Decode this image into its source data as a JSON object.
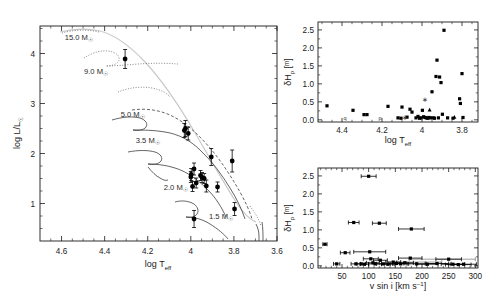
{
  "figure": {
    "panels": [
      {
        "id": "hrd",
        "name": "hertzsprung-russell-diagram",
        "xlabel": "log T",
        "xlabel_sub": "eff",
        "ylabel": "log L/L",
        "ylabel_sub": "☉",
        "xlim": [
          4.7,
          3.6
        ],
        "ylim": [
          0.25,
          4.55
        ],
        "xticks": [
          "4.6",
          "4.4",
          "4.2",
          "4",
          "3.8",
          "3.6"
        ],
        "xtickvals": [
          4.6,
          4.4,
          4.2,
          4.0,
          3.8,
          3.6
        ],
        "yticks": [
          "1",
          "2",
          "3",
          "4"
        ],
        "ytickvals": [
          1,
          2,
          3,
          4
        ],
        "track_labels": [
          {
            "text": "15.0 M",
            "sub": "☉",
            "x": 4.52,
            "y": 4.27
          },
          {
            "text": "9.0 M",
            "sub": "☉",
            "x": 4.44,
            "y": 3.6
          },
          {
            "text": "5.0 M",
            "sub": "☉",
            "x": 4.27,
            "y": 2.73
          },
          {
            "text": "3.5 M",
            "sub": "☉",
            "x": 4.2,
            "y": 2.22
          },
          {
            "text": "2.0 M",
            "sub": "☉",
            "x": 4.07,
            "y": 1.28
          },
          {
            "text": "1.5 M",
            "sub": "☉",
            "x": 3.86,
            "y": 0.7
          }
        ]
      },
      {
        "id": "delta-hp-vs-teff",
        "name": "amplitude-vs-temperature",
        "xlabel": "log T",
        "xlabel_sub": "eff",
        "ylabel": "δH",
        "ylabel_sub": "p",
        "ylabel_unit": "[ᵐ]",
        "xlim": [
          4.52,
          3.72
        ],
        "ylim": [
          -0.06,
          2.72
        ],
        "xticks": [
          "4.4",
          "4.2",
          "4",
          "3.8"
        ],
        "xtickvals": [
          4.4,
          4.2,
          4.0,
          3.8
        ],
        "yticks": [
          "0.0",
          "0.5",
          "1.0",
          "1.5",
          "2.0",
          "2.5"
        ],
        "ytickvals": [
          0.0,
          0.5,
          1.0,
          1.5,
          2.0,
          2.5
        ],
        "letter_markers": [
          {
            "label": "q",
            "x": 4.385,
            "y": 0.055
          },
          {
            "label": "p",
            "x": 4.21,
            "y": 0.055
          }
        ]
      },
      {
        "id": "delta-hp-vs-vsini",
        "name": "amplitude-vs-rotation",
        "xlabel": "v sin i [km s",
        "xlabel_sup": "−1",
        "xlabel_end": "]",
        "ylabel": "δH",
        "ylabel_sub": "p",
        "ylabel_unit": "[ᵐ]",
        "xlim": [
          5,
          305
        ],
        "ylim": [
          -0.06,
          2.72
        ],
        "xticks": [
          "50",
          "100",
          "150",
          "200",
          "250",
          "300"
        ],
        "xtickvals": [
          50,
          100,
          150,
          200,
          250,
          300
        ],
        "yticks": [
          "0.0",
          "0.5",
          "1.0",
          "1.5",
          "2.0",
          "2.5"
        ],
        "ytickvals": [
          0.0,
          0.5,
          1.0,
          1.5,
          2.0,
          2.5
        ]
      }
    ]
  },
  "chart_data": [
    {
      "type": "scatter",
      "id": "hrd",
      "title": "",
      "xlabel": "log T_eff",
      "ylabel": "log L/L_sun",
      "xlim": [
        4.7,
        3.6
      ],
      "ylim": [
        0.25,
        4.55
      ],
      "grid": false,
      "legend": "none",
      "note": "Hertzsprung-Russell diagram with stellar evolutionary tracks labelled by mass; filled circles are programme stars with vertical luminosity error bars.",
      "points": [
        {
          "x": 4.305,
          "y": 3.89,
          "yerr": 0.19
        },
        {
          "x": 4.025,
          "y": 2.5,
          "yerr": 0.16
        },
        {
          "x": 4.03,
          "y": 2.46,
          "yerr": 0.14
        },
        {
          "x": 4.012,
          "y": 2.4,
          "yerr": 0.13
        },
        {
          "x": 3.905,
          "y": 1.93,
          "yerr": 0.17
        },
        {
          "x": 3.808,
          "y": 1.85,
          "yerr": 0.22
        },
        {
          "x": 3.985,
          "y": 1.69,
          "yerr": 0.12
        },
        {
          "x": 3.998,
          "y": 1.58,
          "yerr": 0.12
        },
        {
          "x": 4.0,
          "y": 1.53,
          "yerr": 0.11
        },
        {
          "x": 3.955,
          "y": 1.56,
          "yerr": 0.1
        },
        {
          "x": 3.948,
          "y": 1.52,
          "yerr": 0.1
        },
        {
          "x": 3.938,
          "y": 1.5,
          "yerr": 0.1
        },
        {
          "x": 3.975,
          "y": 1.41,
          "yerr": 0.1
        },
        {
          "x": 3.992,
          "y": 1.34,
          "yerr": 0.1
        },
        {
          "x": 3.928,
          "y": 1.35,
          "yerr": 0.12
        },
        {
          "x": 3.876,
          "y": 1.33,
          "yerr": 0.1
        },
        {
          "x": 3.797,
          "y": 0.89,
          "yerr": 0.13
        },
        {
          "x": 3.985,
          "y": 0.69,
          "yerr": 0.17
        }
      ],
      "tracks": [
        {
          "mass": "15.0",
          "style": "pale"
        },
        {
          "mass": "9.0",
          "style": "dotted"
        },
        {
          "mass": "5.0",
          "style": "dashed"
        },
        {
          "mass": "3.5",
          "style": "solid"
        },
        {
          "mass": "2.0",
          "style": "solid"
        },
        {
          "mass": "1.5",
          "style": "solid"
        }
      ]
    },
    {
      "type": "scatter",
      "id": "delta-hp-vs-teff",
      "title": "",
      "xlabel": "log T_eff",
      "ylabel": "delta H_p [mmag]",
      "xlim": [
        4.52,
        3.72
      ],
      "ylim": [
        -0.06,
        2.72
      ],
      "grid": false,
      "legend": "none",
      "note": "Photometric amplitude versus effective temperature; amplitudes rise toward cooler temperatures around log T_eff ~ 3.9.",
      "points": [
        {
          "x": 4.475,
          "y": 0.39
        },
        {
          "x": 4.345,
          "y": 0.265
        },
        {
          "x": 4.29,
          "y": 0.145
        },
        {
          "x": 4.275,
          "y": 0.145
        },
        {
          "x": 4.17,
          "y": 0.375
        },
        {
          "x": 4.12,
          "y": 0.055
        },
        {
          "x": 4.105,
          "y": 0.045
        },
        {
          "x": 4.1,
          "y": 0.355
        },
        {
          "x": 4.075,
          "y": 0.075
        },
        {
          "x": 4.06,
          "y": 0.295
        },
        {
          "x": 4.05,
          "y": 0.215
        },
        {
          "x": 4.03,
          "y": 0.055
        },
        {
          "x": 4.02,
          "y": 0.095
        },
        {
          "x": 4.012,
          "y": 0.045
        },
        {
          "x": 4.005,
          "y": 0.055
        },
        {
          "x": 3.998,
          "y": 0.265
        },
        {
          "x": 3.992,
          "y": 0.085
        },
        {
          "x": 3.985,
          "y": 0.065
        },
        {
          "x": 3.978,
          "y": 0.055
        },
        {
          "x": 3.972,
          "y": 0.045
        },
        {
          "x": 3.965,
          "y": 0.065
        },
        {
          "x": 3.958,
          "y": 0.055
        },
        {
          "x": 3.95,
          "y": 0.78
        },
        {
          "x": 3.944,
          "y": 0.055
        },
        {
          "x": 3.938,
          "y": 0.045
        },
        {
          "x": 3.93,
          "y": 1.205
        },
        {
          "x": 3.925,
          "y": 1.66
        },
        {
          "x": 3.918,
          "y": 0.055
        },
        {
          "x": 3.912,
          "y": 1.19
        },
        {
          "x": 3.905,
          "y": 1.035
        },
        {
          "x": 3.898,
          "y": 0.155
        },
        {
          "x": 3.89,
          "y": 2.49
        },
        {
          "x": 3.872,
          "y": 0.055
        },
        {
          "x": 3.845,
          "y": 0.045
        },
        {
          "x": 3.812,
          "y": 0.585
        },
        {
          "x": 3.808,
          "y": 0.455
        },
        {
          "x": 3.8,
          "y": 1.285
        },
        {
          "x": 3.795,
          "y": 0.065
        }
      ],
      "special_markers": [
        {
          "x": 4.385,
          "y": 0.055,
          "symbol": "q"
        },
        {
          "x": 4.21,
          "y": 0.055,
          "symbol": "p"
        },
        {
          "x": 3.985,
          "y": 0.56,
          "symbol": "asterisk"
        },
        {
          "x": 4.085,
          "y": 0.065,
          "symbol": "asterisk"
        },
        {
          "x": 3.962,
          "y": 0.275,
          "symbol": "triangle"
        },
        {
          "x": 3.838,
          "y": 0.075,
          "symbol": "triangle"
        }
      ]
    },
    {
      "type": "scatter",
      "id": "delta-hp-vs-vsini",
      "title": "",
      "xlabel": "v sin i [km s^-1]",
      "ylabel": "delta H_p [mmag]",
      "xlim": [
        5,
        305
      ],
      "ylim": [
        -0.06,
        2.72
      ],
      "grid": false,
      "legend": "none",
      "note": "Photometric amplitude versus projected rotational velocity with horizontal v sin i error bars; most stars have small amplitudes.",
      "points": [
        {
          "x": 18,
          "y": 0.6,
          "xerr": 4
        },
        {
          "x": 40,
          "y": 0.055,
          "xerr": 6
        },
        {
          "x": 56,
          "y": 0.365,
          "xerr": 9
        },
        {
          "x": 72,
          "y": 1.205,
          "xerr": 10
        },
        {
          "x": 76,
          "y": 0.055,
          "xerr": 9
        },
        {
          "x": 86,
          "y": 0.055,
          "xerr": 8
        },
        {
          "x": 92,
          "y": 0.045,
          "xerr": 8
        },
        {
          "x": 100,
          "y": 2.49,
          "xerr": 14
        },
        {
          "x": 102,
          "y": 0.39,
          "xerr": 30
        },
        {
          "x": 104,
          "y": 0.195,
          "xerr": 14
        },
        {
          "x": 108,
          "y": 0.085,
          "xerr": 12
        },
        {
          "x": 112,
          "y": 0.055,
          "xerr": 12
        },
        {
          "x": 120,
          "y": 1.185,
          "xerr": 13
        },
        {
          "x": 122,
          "y": 0.155,
          "xerr": 13
        },
        {
          "x": 128,
          "y": 0.055,
          "xerr": 13
        },
        {
          "x": 136,
          "y": 0.045,
          "xerr": 12
        },
        {
          "x": 146,
          "y": 0.105,
          "xerr": 14
        },
        {
          "x": 152,
          "y": 0.065,
          "xerr": 14
        },
        {
          "x": 160,
          "y": 0.055,
          "xerr": 15
        },
        {
          "x": 168,
          "y": 0.085,
          "xerr": 16
        },
        {
          "x": 178,
          "y": 0.215,
          "xerr": 22
        },
        {
          "x": 180,
          "y": 1.025,
          "xerr": 24
        },
        {
          "x": 190,
          "y": 0.055,
          "xerr": 18
        },
        {
          "x": 210,
          "y": 0.045,
          "xerr": 20
        },
        {
          "x": 228,
          "y": 0.065,
          "xerr": 22
        },
        {
          "x": 250,
          "y": 0.185,
          "xerr": 24
        },
        {
          "x": 258,
          "y": 0.045,
          "xerr": 22
        },
        {
          "x": 268,
          "y": 0.035,
          "xerr": 24
        },
        {
          "x": 278,
          "y": 0.045,
          "xerr": 24
        }
      ],
      "grey_error_bars": [
        {
          "x": 238,
          "y": 0.185,
          "xerr": 62
        },
        {
          "x": 195,
          "y": 0.105,
          "xerr": 42
        },
        {
          "x": 200,
          "y": 0.065,
          "xerr": 55
        }
      ]
    }
  ]
}
